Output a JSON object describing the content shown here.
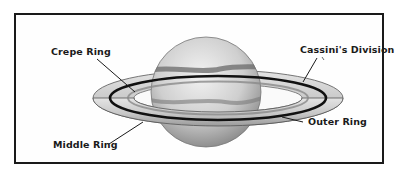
{
  "diagram": {
    "labels": {
      "crepe_ring": "Crepe Ring",
      "cassini_division": "Cassini's Division",
      "middle_ring": "Middle Ring",
      "outer_ring": "Outer Ring"
    },
    "colors": {
      "ink": "#1a1a1a",
      "planet_light": "#e6e6e6",
      "planet_shade": "#9a9a9a",
      "ring_light": "#d8d8d8",
      "ring_dark": "#8c8c8c"
    }
  }
}
